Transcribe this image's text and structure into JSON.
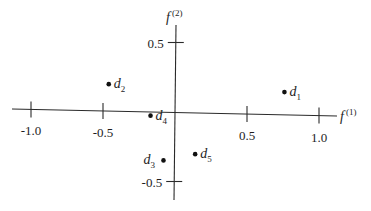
{
  "chart_data": {
    "type": "scatter",
    "title": "",
    "xlabel": "f(1)",
    "ylabel": "f(2)",
    "xlabel_base": "f",
    "xlabel_sup": "(1)",
    "ylabel_base": "f",
    "ylabel_sup": "(2)",
    "xlim": [
      -1.1,
      1.1
    ],
    "ylim": [
      -0.6,
      0.6
    ],
    "grid": false,
    "legend": null,
    "x_ticks": [
      {
        "value": -1.0,
        "label": "-1.0"
      },
      {
        "value": -0.5,
        "label": "-0.5"
      },
      {
        "value": 0.5,
        "label": "0.5"
      },
      {
        "value": 1.0,
        "label": "1.0"
      }
    ],
    "y_ticks": [
      {
        "value": 0.5,
        "label": "0.5"
      },
      {
        "value": -0.5,
        "label": "-0.5"
      }
    ],
    "points": [
      {
        "label": "d",
        "sub": "1",
        "name": "d1",
        "x": 0.76,
        "y": 0.16,
        "label_side": "right"
      },
      {
        "label": "d",
        "sub": "2",
        "name": "d2",
        "x": -0.46,
        "y": 0.19,
        "label_side": "right"
      },
      {
        "label": "d",
        "sub": "3",
        "name": "d3",
        "x": -0.08,
        "y": -0.35,
        "label_side": "left"
      },
      {
        "label": "d",
        "sub": "4",
        "name": "d4",
        "x": -0.17,
        "y": -0.03,
        "label_side": "right"
      },
      {
        "label": "d",
        "sub": "5",
        "name": "d5",
        "x": 0.14,
        "y": -0.3,
        "label_side": "right"
      }
    ]
  }
}
